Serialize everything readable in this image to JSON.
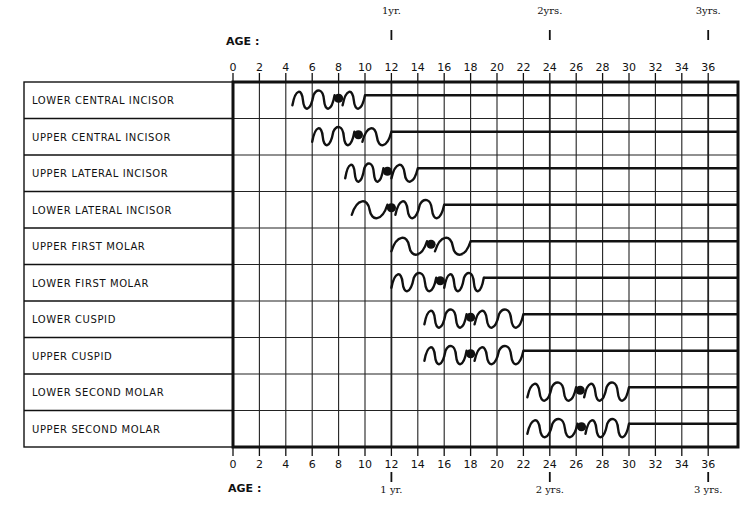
{
  "chart_data": {
    "type": "gantt-timeline",
    "xlabel": "AGE :",
    "x_unit": "months",
    "xlim": [
      0,
      36
    ],
    "x_ticks": [
      0,
      2,
      4,
      6,
      8,
      10,
      12,
      14,
      16,
      18,
      20,
      22,
      24,
      26,
      28,
      30,
      32,
      34,
      36
    ],
    "year_markers": [
      {
        "month": 12,
        "top_label": "1yr.",
        "bottom_label": "1 yr."
      },
      {
        "month": 24,
        "top_label": "2yrs.",
        "bottom_label": "2 yrs."
      },
      {
        "month": 36,
        "top_label": "3yrs.",
        "bottom_label": "3 yrs."
      }
    ],
    "grid": true,
    "legend": "wavy line = eruption range; dot = average eruption age; straight line = tooth present",
    "series": [
      {
        "name": "LOWER CENTRAL INCISOR",
        "start": 4.5,
        "mean": 8,
        "end": 10
      },
      {
        "name": "UPPER CENTRAL INCISOR",
        "start": 6,
        "mean": 9.5,
        "end": 12
      },
      {
        "name": "UPPER LATERAL INCISOR",
        "start": 8.5,
        "mean": 11.7,
        "end": 14
      },
      {
        "name": "LOWER LATERAL INCISOR",
        "start": 9,
        "mean": 12,
        "end": 16
      },
      {
        "name": "UPPER FIRST MOLAR",
        "start": 12,
        "mean": 15,
        "end": 18
      },
      {
        "name": "LOWER FIRST MOLAR",
        "start": 12,
        "mean": 15.7,
        "end": 19
      },
      {
        "name": "LOWER CUSPID",
        "start": 14.5,
        "mean": 18,
        "end": 22
      },
      {
        "name": "UPPER CUSPID",
        "start": 14.5,
        "mean": 18,
        "end": 22
      },
      {
        "name": "LOWER SECOND MOLAR",
        "start": 22.3,
        "mean": 26.3,
        "end": 30
      },
      {
        "name": "UPPER SECOND MOLAR",
        "start": 22.3,
        "mean": 26.4,
        "end": 30
      }
    ]
  },
  "labels": {
    "age_top": "AGE :",
    "age_bottom": "AGE :"
  }
}
